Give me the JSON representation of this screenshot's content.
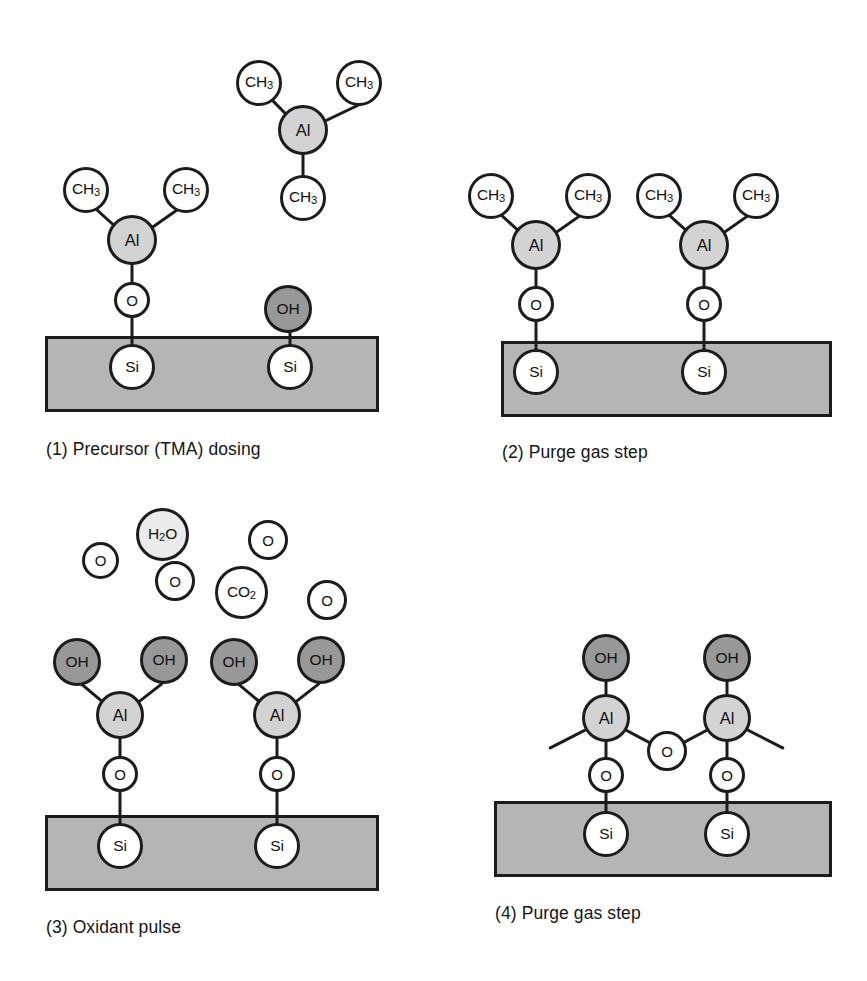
{
  "figure": {
    "colors": {
      "substrate_fill": "#b5b5b5",
      "outline": "#1c1c1c",
      "al_fill": "#d3d3d3",
      "oh_fill": "#989898",
      "o_fill": "#ffffff",
      "si_fill": "#ffffff",
      "ch3_fill": "#ffffff",
      "h2o_fill": "#ebebeb",
      "co2_fill": "#f7f7f7",
      "background": "#ffffff"
    }
  },
  "panels": [
    {
      "id": "panel-1",
      "caption": "(1) Precursor (TMA) dosing",
      "species": [
        "CH3",
        "Al",
        "O",
        "OH",
        "Si"
      ],
      "surface_groups": [
        {
          "type": "Al(CH3)2-O-Si",
          "ligands": [
            "CH3",
            "CH3"
          ],
          "center": "Al",
          "link": "O",
          "anchor": "Si"
        },
        {
          "type": "OH-Si",
          "ligands": [],
          "center": "OH",
          "anchor": "Si"
        }
      ],
      "gas_phase": [
        {
          "type": "Al(CH3)3",
          "center": "Al",
          "ligands": [
            "CH3",
            "CH3",
            "CH3"
          ]
        }
      ]
    },
    {
      "id": "panel-2",
      "caption": "(2) Purge gas step",
      "species": [
        "CH3",
        "Al",
        "O",
        "Si"
      ],
      "surface_groups": [
        {
          "type": "Al(CH3)2-O-Si",
          "ligands": [
            "CH3",
            "CH3"
          ],
          "center": "Al",
          "link": "O",
          "anchor": "Si"
        },
        {
          "type": "Al(CH3)2-O-Si",
          "ligands": [
            "CH3",
            "CH3"
          ],
          "center": "Al",
          "link": "O",
          "anchor": "Si"
        }
      ],
      "gas_phase": []
    },
    {
      "id": "panel-3",
      "caption": "(3) Oxidant pulse",
      "species": [
        "OH",
        "Al",
        "O",
        "Si",
        "H2O",
        "CO2"
      ],
      "surface_groups": [
        {
          "type": "Al(OH)2-O-Si",
          "ligands": [
            "OH",
            "OH"
          ],
          "center": "Al",
          "link": "O",
          "anchor": "Si"
        },
        {
          "type": "Al(OH)2-O-Si",
          "ligands": [
            "OH",
            "OH"
          ],
          "center": "Al",
          "link": "O",
          "anchor": "Si"
        }
      ],
      "gas_phase": [
        "O",
        "H2O",
        "O",
        "O",
        "CO2",
        "O"
      ]
    },
    {
      "id": "panel-4",
      "caption": "(4) Purge gas step",
      "species": [
        "OH",
        "Al",
        "O",
        "Si"
      ],
      "surface_groups": [
        {
          "type": "OH-Al(-O-Si)(-O-bridge)",
          "ligands": [
            "OH"
          ],
          "center": "Al",
          "link": "O",
          "anchor": "Si"
        },
        {
          "type": "OH-Al(-O-Si)(-O-bridge)",
          "ligands": [
            "OH"
          ],
          "center": "Al",
          "link": "O",
          "anchor": "Si"
        }
      ],
      "bridge": {
        "atom": "O",
        "between": [
          "Al",
          "Al"
        ]
      },
      "gas_phase": []
    }
  ],
  "labels": {
    "ch3": "CH3",
    "ch3_base": "CH",
    "ch3_sub": "3",
    "al": "Al",
    "o": "O",
    "oh": "OH",
    "si": "Si",
    "h2o_base1": "H",
    "h2o_sub": "2",
    "h2o_base2": "O",
    "co2_base": "CO",
    "co2_sub": "2"
  },
  "captions": {
    "p1": "(1) Precursor (TMA) dosing",
    "p2": "(2) Purge gas step",
    "p3": "(3) Oxidant pulse",
    "p4": "(4) Purge gas step"
  }
}
